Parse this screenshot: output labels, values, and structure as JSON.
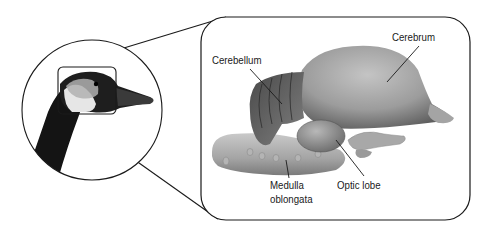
{
  "figure": {
    "inset": {
      "shape": "circle",
      "content": "goose head with brain region outlined"
    },
    "callout_box": {
      "shape": "rounded-rectangle",
      "content": "enlarged brain illustration"
    },
    "labels": {
      "cerebrum": "Cerebrum",
      "cerebellum": "Cerebellum",
      "medulla_line1": "Medulla",
      "medulla_line2": "oblongata",
      "optic_lobe": "Optic lobe"
    },
    "colors": {
      "outline": "#1a1a1a",
      "brain_light": "#c8c8c8",
      "brain_mid": "#9a9a9a",
      "brain_dark": "#5a5a5a",
      "neck_black": "#111111",
      "background": "#ffffff"
    }
  }
}
